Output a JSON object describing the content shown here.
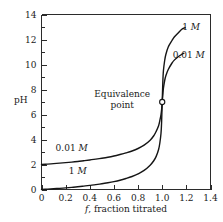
{
  "chart_data": {
    "type": "line",
    "title": "",
    "subtitle": "",
    "xlabel": "f, fraction titrated",
    "xlabel_italic_part": "f",
    "xlabel_rest": ", fraction titrated",
    "ylabel": "pH",
    "xlim": [
      0,
      1.4
    ],
    "ylim": [
      0,
      14
    ],
    "grid": false,
    "legend_position": "inline-curve-labels",
    "x_ticks": [
      0,
      0.2,
      0.4,
      0.6,
      0.8,
      1.0,
      1.2,
      1.4
    ],
    "x_tick_labels": [
      "0",
      "0.2",
      "0.4",
      "0.6",
      "0.8",
      "1.0",
      "1.2",
      "1.4"
    ],
    "y_ticks": [
      0,
      1,
      2,
      3,
      4,
      5,
      6,
      7,
      8,
      9,
      10,
      11,
      12,
      13,
      14
    ],
    "y_tick_labels_major": [
      "0",
      "2",
      "4",
      "6",
      "8",
      "10",
      "12",
      "14"
    ],
    "y_ticks_major": [
      0,
      2,
      4,
      6,
      8,
      10,
      12,
      14
    ],
    "series": [
      {
        "name": "1 M",
        "name_value": "1",
        "name_unit": "M",
        "points": [
          [
            0.0,
            0.0
          ],
          [
            0.05,
            0.03
          ],
          [
            0.1,
            0.06
          ],
          [
            0.15,
            0.09
          ],
          [
            0.2,
            0.13
          ],
          [
            0.25,
            0.17
          ],
          [
            0.3,
            0.22
          ],
          [
            0.35,
            0.27
          ],
          [
            0.4,
            0.33
          ],
          [
            0.45,
            0.39
          ],
          [
            0.5,
            0.46
          ],
          [
            0.55,
            0.54
          ],
          [
            0.6,
            0.63
          ],
          [
            0.65,
            0.74
          ],
          [
            0.7,
            0.88
          ],
          [
            0.75,
            1.04
          ],
          [
            0.8,
            1.25
          ],
          [
            0.85,
            1.53
          ],
          [
            0.9,
            1.95
          ],
          [
            0.93,
            2.3
          ],
          [
            0.95,
            2.65
          ],
          [
            0.97,
            3.2
          ],
          [
            0.98,
            3.7
          ],
          [
            0.99,
            4.5
          ],
          [
            0.995,
            5.4
          ],
          [
            1.0,
            7.0
          ],
          [
            1.005,
            8.6
          ],
          [
            1.01,
            9.5
          ],
          [
            1.02,
            10.3
          ],
          [
            1.03,
            10.8
          ],
          [
            1.05,
            11.4
          ],
          [
            1.08,
            11.9
          ],
          [
            1.1,
            12.2
          ],
          [
            1.13,
            12.5
          ],
          [
            1.16,
            12.8
          ],
          [
            1.19,
            12.95
          ]
        ]
      },
      {
        "name": "0.01 M",
        "name_value": "0.01",
        "name_unit": "M",
        "points": [
          [
            0.0,
            2.0
          ],
          [
            0.05,
            2.03
          ],
          [
            0.1,
            2.07
          ],
          [
            0.15,
            2.11
          ],
          [
            0.2,
            2.15
          ],
          [
            0.25,
            2.19
          ],
          [
            0.3,
            2.24
          ],
          [
            0.35,
            2.3
          ],
          [
            0.4,
            2.36
          ],
          [
            0.45,
            2.43
          ],
          [
            0.5,
            2.5
          ],
          [
            0.55,
            2.58
          ],
          [
            0.6,
            2.68
          ],
          [
            0.65,
            2.8
          ],
          [
            0.7,
            2.93
          ],
          [
            0.75,
            3.08
          ],
          [
            0.8,
            3.28
          ],
          [
            0.85,
            3.55
          ],
          [
            0.9,
            3.95
          ],
          [
            0.93,
            4.3
          ],
          [
            0.95,
            4.65
          ],
          [
            0.97,
            5.1
          ],
          [
            0.98,
            5.5
          ],
          [
            0.99,
            6.0
          ],
          [
            0.995,
            6.4
          ],
          [
            1.0,
            7.0
          ],
          [
            1.005,
            7.6
          ],
          [
            1.01,
            8.1
          ],
          [
            1.02,
            8.7
          ],
          [
            1.03,
            9.1
          ],
          [
            1.05,
            9.6
          ],
          [
            1.08,
            10.1
          ],
          [
            1.1,
            10.35
          ],
          [
            1.13,
            10.6
          ],
          [
            1.16,
            10.8
          ],
          [
            1.18,
            10.9
          ]
        ]
      }
    ],
    "annotations": [
      {
        "id": "equivalence-point",
        "text_line1": "Equivalence",
        "text_line2": "point",
        "x": 1.0,
        "y": 7.0
      },
      {
        "id": "label-1m-upper",
        "text_value": "1",
        "text_unit": "M",
        "x": 1.24,
        "y": 12.75
      },
      {
        "id": "label-001m-upper",
        "text_value": "0.01",
        "text_unit": "M",
        "x": 1.22,
        "y": 10.55
      },
      {
        "id": "label-001m-lower",
        "text_value": "0.01",
        "text_unit": "M",
        "x": 0.25,
        "y": 3.1
      },
      {
        "id": "label-1m-lower",
        "text_value": "1",
        "text_unit": "M",
        "x": 0.3,
        "y": 1.25
      }
    ],
    "colors": {
      "curve": "#151515",
      "axis": "#2b2b2b",
      "background": "#ffffff",
      "text": "#1a1a1a"
    }
  }
}
